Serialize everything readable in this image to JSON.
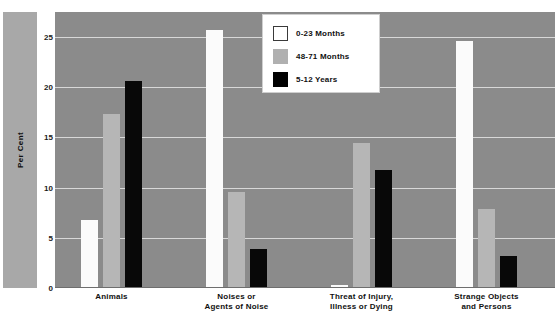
{
  "chart_data": {
    "type": "bar",
    "title": "",
    "xlabel": "",
    "ylabel": "Per Cent",
    "ylim": [
      0,
      27.5
    ],
    "yticks": [
      0,
      5,
      10,
      15,
      20,
      25
    ],
    "ytick_labels": [
      "0",
      "5",
      "10",
      "15",
      "20",
      "25"
    ],
    "grid": true,
    "legend_position": "top-center-right",
    "categories": [
      "Animals",
      "Noises or\nAgents of Noise",
      "Threat of Injury,\nIllness or Dying",
      "Strange Objects\nand Persons"
    ],
    "series": [
      {
        "name": "0-23 Months",
        "color": "#ffffff",
        "values": [
          6.8,
          25.7,
          0.3,
          24.6
        ]
      },
      {
        "name": "48-71 Months",
        "color": "#b0b0b0",
        "values": [
          17.3,
          9.6,
          14.4,
          7.9
        ]
      },
      {
        "name": "5-12 Years",
        "color": "#000000",
        "values": [
          20.6,
          3.9,
          11.8,
          3.2
        ]
      }
    ],
    "plot_background": "#8b8b8b",
    "gridline_color": "#d8d8d8"
  },
  "legend": {
    "items": [
      {
        "label": "0-23 Months"
      },
      {
        "label": "48-71 Months"
      },
      {
        "label": "5-12 Years"
      }
    ]
  },
  "axis": {
    "y_title": "Per Cent"
  }
}
